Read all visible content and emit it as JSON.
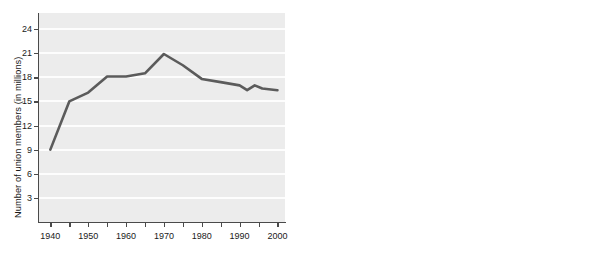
{
  "chart_data": [
    {
      "type": "line",
      "panel": "left",
      "title": "",
      "xlabel": "",
      "ylabel": "Number of union members (in millions)",
      "xlim": [
        1937,
        2002
      ],
      "ylim": [
        0,
        26
      ],
      "xticks": [
        1940,
        1945,
        1950,
        1955,
        1960,
        1965,
        1970,
        1975,
        1980,
        1985,
        1990,
        1995,
        2000
      ],
      "xticklabels": [
        "1940",
        "",
        "1950",
        "",
        "1960",
        "",
        "1970",
        "",
        "1980",
        "",
        "1990",
        "",
        "2000"
      ],
      "yticks": [
        3,
        6,
        9,
        12,
        15,
        18,
        21,
        24
      ],
      "yticklabels": [
        "3",
        "6",
        "9",
        "12",
        "15",
        "18",
        "21",
        "24"
      ],
      "grid": "horizontal",
      "legend": "none",
      "x": [
        1940,
        1945,
        1950,
        1955,
        1960,
        1965,
        1970,
        1975,
        1980,
        1985,
        1990,
        1992,
        1994,
        1996,
        2000
      ],
      "values": [
        9.0,
        15.0,
        16.1,
        18.1,
        18.1,
        18.5,
        20.9,
        19.5,
        17.8,
        17.4,
        17.0,
        16.4,
        17.0,
        16.6,
        16.4
      ],
      "series_color": "#5b5b5b",
      "plot_background": "#ececec",
      "gridline_color": "#ffffff"
    },
    {
      "type": "line",
      "panel": "right",
      "title": "",
      "xlabel": "",
      "ylabel": "Union members as percentage of total labor force",
      "xlim": [
        1937,
        2002
      ],
      "ylim": [
        0,
        27
      ],
      "xticks": [
        1940,
        1945,
        1950,
        1955,
        1960,
        1965,
        1970,
        1975,
        1980,
        1985,
        1990,
        1995,
        2000
      ],
      "xticklabels": [
        "1940",
        "",
        "1950",
        "",
        "1960",
        "",
        "1970",
        "",
        "1980",
        "",
        "1990",
        "",
        "2000"
      ],
      "yticks": [
        5,
        10,
        15,
        20,
        25
      ],
      "yticklabels": [
        "5",
        "10",
        "15",
        "20",
        "25"
      ],
      "grid": "horizontal",
      "legend": "none",
      "x": [
        1940,
        1945,
        1950,
        1955,
        1960,
        1965,
        1970,
        1975,
        1980,
        1985,
        1989,
        1990,
        1993,
        1995,
        2000
      ],
      "values": [
        15.1,
        23.0,
        23.0,
        25.1,
        23.8,
        22.0,
        23.1,
        21.5,
        19.5,
        18.0,
        17.1,
        16.2,
        16.0,
        15.2,
        13.5
      ],
      "series_color": "#5b5b5b",
      "plot_background": "#ececec",
      "gridline_color": "#ffffff"
    }
  ]
}
